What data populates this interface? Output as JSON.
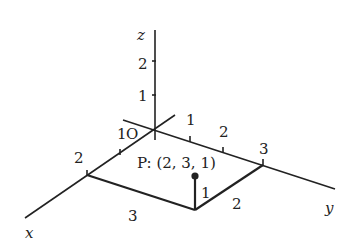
{
  "diagram": {
    "type": "3d-coordinate-axes",
    "axes": {
      "x": {
        "label": "x",
        "ticks": [
          "1",
          "2"
        ]
      },
      "y": {
        "label": "y",
        "ticks": [
          "1",
          "2",
          "3"
        ]
      },
      "z": {
        "label": "z",
        "ticks": [
          "1",
          "2"
        ]
      }
    },
    "origin_label": "O",
    "point": {
      "label": "P: (2, 3, 1)",
      "coords": [
        2,
        3,
        1
      ]
    },
    "box_edge_labels": {
      "x_side": "3",
      "y_side": "2",
      "height": "1"
    },
    "colors": {
      "stroke": "#222222",
      "background": "#ffffff"
    }
  }
}
